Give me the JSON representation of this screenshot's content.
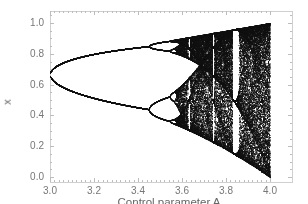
{
  "chart_data": {
    "type": "scatter",
    "title": "",
    "subtitle": "Bifurcation diagram of the logistic map x(n+1) = A·x(n)·(1−x(n))",
    "xlabel": "Control parameter A",
    "ylabel": "x",
    "xlim": [
      3.0,
      4.0
    ],
    "ylim": [
      0.0,
      1.0
    ],
    "x_ticks": [
      "3.0",
      "3.2",
      "3.4",
      "3.6",
      "3.8",
      "4.0"
    ],
    "y_ticks": [
      "0.0",
      "0.2",
      "0.4",
      "0.6",
      "0.8",
      "1.0"
    ],
    "grid": false,
    "legend": null,
    "marker_color": "#111111",
    "features": [
      {
        "A": 3.0,
        "x": [
          0.667
        ],
        "note": "single fixed point splits into period-2"
      },
      {
        "A": 3.449,
        "x": [
          0.85,
          0.44
        ],
        "note": "period-2 branches at ~0.85 and ~0.44 split into period-4"
      },
      {
        "A": 3.544,
        "note": "period-8 onset"
      },
      {
        "A": 3.57,
        "note": "onset of chaos"
      },
      {
        "A": 3.83,
        "x_range": [
          0.16,
          0.96
        ],
        "note": "period-3 window (white vertical band)"
      },
      {
        "A": 4.0,
        "x_range": [
          0.0,
          1.0
        ],
        "note": "full chaotic band"
      }
    ]
  },
  "axes": {
    "xlabel": "Control parameter A",
    "ylabel": "x"
  }
}
